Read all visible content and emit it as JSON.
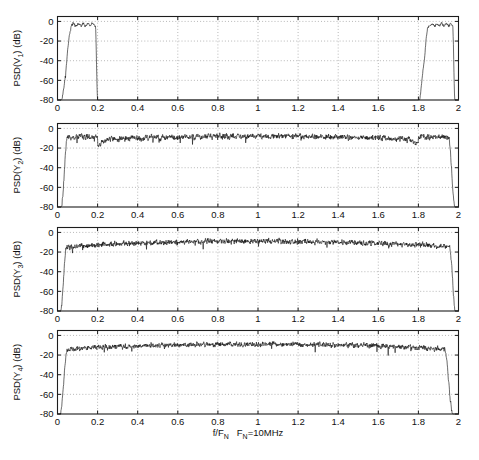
{
  "figure": {
    "title": "",
    "width": 479,
    "height": 460,
    "background": "#ffffff",
    "trace_color": "#111111",
    "grid_color": "#9a9a9a",
    "axis_color": "#1d1d1d"
  },
  "axis": {
    "xlabel_main": "f/F",
    "xlabel_main_sub": "N",
    "xlabel_note": "F",
    "xlabel_note_sub": "N",
    "xlabel_note_tail": "=10MHz",
    "xlabel_full": "f/F_N   F_N=10MHz",
    "xticks": [
      "0",
      "0.2",
      "0.4",
      "0.6",
      "0.8",
      "1",
      "1.2",
      "1.4",
      "1.6",
      "1.8",
      "2"
    ],
    "xtick_values": [
      0,
      0.2,
      0.4,
      0.6,
      0.8,
      1,
      1.2,
      1.4,
      1.6,
      1.8,
      2
    ],
    "xlim": [
      0,
      2
    ],
    "yticks": [
      "0",
      "-20",
      "-40",
      "-60",
      "-80"
    ],
    "ytick_values": [
      0,
      -20,
      -40,
      -60,
      -80
    ],
    "ylim": [
      -80,
      5
    ],
    "grid": true,
    "legend": "none"
  },
  "chart_data": [
    {
      "type": "line",
      "index": 0,
      "title": "",
      "ylabel": "PSD(V",
      "ylabel_sub": "1",
      "ylabel_tail": ") (dB)",
      "ylabel_full": "PSD(V_1) (dB)",
      "xlabel": "",
      "xlim": [
        0,
        2
      ],
      "ylim": [
        -80,
        5
      ],
      "xticks": [
        0,
        0.2,
        0.4,
        0.6,
        0.8,
        1,
        1.2,
        1.4,
        1.6,
        1.8,
        2
      ],
      "yticks": [
        0,
        -20,
        -40,
        -60,
        -80
      ],
      "grid": true,
      "description": "Baseband bandpass spectrum: passband from 0.02 to 0.2 near -3 dB with ripple, mirror image passband from 1.8 to 1.98, deep stopband below -80 dB elsewhere.",
      "floor_db": -80,
      "passbands": [
        {
          "start": 0.018,
          "end": 0.2,
          "level_db": -3.5,
          "ripple_db": 5.5
        },
        {
          "start": 1.8,
          "end": 1.982,
          "level_db": -3.5,
          "ripple_db": 5.5
        }
      ],
      "noise_db": 1.6,
      "seed": 11
    },
    {
      "type": "line",
      "index": 1,
      "title": "",
      "ylabel": "PSD(Y",
      "ylabel_sub": "2",
      "ylabel_tail": ") (dB)",
      "ylabel_full": "PSD(Y_2) (dB)",
      "xlabel": "",
      "xlim": [
        0,
        2
      ],
      "ylim": [
        -80,
        5
      ],
      "xticks": [
        0,
        0.2,
        0.4,
        0.6,
        0.8,
        1,
        1.2,
        1.4,
        1.6,
        1.8,
        2
      ],
      "yticks": [
        0,
        -20,
        -40,
        -60,
        -80
      ],
      "grid": true,
      "description": "Wideband spectrum spanning 0.02 to 1.98 with a step discontinuity (notch) at 0.2 and at 1.8; center region around -8 dB, edges near -14 dB, sharp roll-off at both ends.",
      "floor_db": -80,
      "center_db": -8.0,
      "edge_db": -15.0,
      "notch_x": [
        0.2,
        1.8
      ],
      "notch_depth_db": 6.0,
      "segment_top_db": -10.5,
      "noise_db": 3.2,
      "rise_start": 0.018,
      "rise_end": 0.05,
      "fall_start": 1.95,
      "fall_end": 1.982,
      "seed": 23
    },
    {
      "type": "line",
      "index": 2,
      "title": "",
      "ylabel": "PSD(Y",
      "ylabel_sub": "3",
      "ylabel_tail": ") (dB)",
      "ylabel_full": "PSD(Y_3) (dB)",
      "xlabel": "",
      "xlim": [
        0,
        2
      ],
      "ylim": [
        -80,
        5
      ],
      "xticks": [
        0,
        0.2,
        0.4,
        0.6,
        0.8,
        1,
        1.2,
        1.4,
        1.6,
        1.8,
        2
      ],
      "yticks": [
        0,
        -20,
        -40,
        -60,
        -80
      ],
      "grid": true,
      "description": "Smooth wideband spectrum with no notch; flat top near -9 dB across the middle, slightly lower (-16 dB) near both edges, abrupt roll-off at 0.02 and 1.98.",
      "floor_db": -80,
      "center_db": -9.0,
      "edge_db": -17.0,
      "noise_db": 3.0,
      "rise_start": 0.015,
      "rise_end": 0.045,
      "fall_start": 1.955,
      "fall_end": 1.985,
      "seed": 37
    },
    {
      "type": "line",
      "index": 3,
      "title": "",
      "ylabel": "PSD(Y",
      "ylabel_sub": "4",
      "ylabel_tail": ") (dB)",
      "ylabel_full": "PSD(Y_4) (dB)",
      "xlabel": "f/F_N   F_N=10MHz",
      "xlim": [
        0,
        2
      ],
      "ylim": [
        -80,
        5
      ],
      "xticks": [
        0,
        0.2,
        0.4,
        0.6,
        0.8,
        1,
        1.2,
        1.4,
        1.6,
        1.8,
        2
      ],
      "yticks": [
        0,
        -20,
        -40,
        -60,
        -80
      ],
      "grid": true,
      "description": "Smooth wideband spectrum similar to the third, flat near -9 dB, gentle droop past 1.7, steep roll-off at the right edge near 1.97.",
      "floor_db": -80,
      "center_db": -9.0,
      "edge_db": -16.0,
      "noise_db": 2.9,
      "rise_start": 0.012,
      "rise_end": 0.05,
      "fall_start": 1.93,
      "fall_end": 1.972,
      "seed": 53
    }
  ]
}
